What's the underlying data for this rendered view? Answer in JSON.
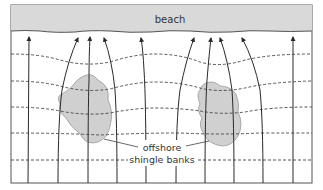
{
  "diagram": {
    "labels": {
      "beach": "beach",
      "banks_line1": "offshore",
      "banks_line2": "shingle banks"
    },
    "colors": {
      "beach_fill": "#d9d9d9",
      "bank_fill": "#d0d0d0",
      "line": "#2a2a2a",
      "dashed": "#444444",
      "border": "#555555"
    },
    "elements": {
      "beach": "shaded strip along top of frame",
      "wave_rays": 10,
      "wave_crests": 5,
      "shingle_banks": 2
    }
  }
}
